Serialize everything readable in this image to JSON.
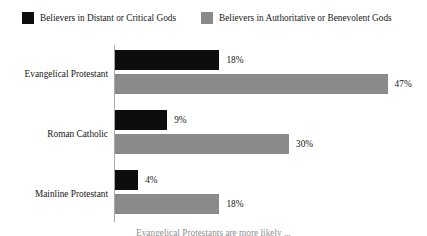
{
  "legend": {
    "items": [
      {
        "label": "Believers in Distant or Critical Gods",
        "color": "#0d0d0d",
        "swatch_name": "legend-swatch-distant-critical"
      },
      {
        "label": "Believers in Authoritative or Benevolent Gods",
        "color": "#8a8a8a",
        "swatch_name": "legend-swatch-authoritative-benevolent"
      }
    ]
  },
  "caption": {
    "text": "Evangelical Protestants are more likely ..."
  },
  "chart_data": {
    "type": "bar",
    "orientation": "horizontal",
    "title": "",
    "xlabel": "",
    "ylabel": "",
    "xlim": [
      0,
      50
    ],
    "grid": false,
    "legend_position": "top",
    "value_suffix": "%",
    "categories": [
      "Evangelical Protestant",
      "Roman Catholic",
      "Mainline Protestant"
    ],
    "series": [
      {
        "name": "Believers in Distant or Critical Gods",
        "color": "#0d0d0d",
        "values": [
          18,
          9,
          4
        ],
        "labels": [
          "18%",
          "9%",
          "4%"
        ]
      },
      {
        "name": "Believers in Authoritative or Benevolent Gods",
        "color": "#8a8a8a",
        "values": [
          47,
          30,
          18
        ],
        "labels": [
          "47%",
          "30%",
          "18%"
        ]
      }
    ],
    "px_per_percent": 5.8
  }
}
